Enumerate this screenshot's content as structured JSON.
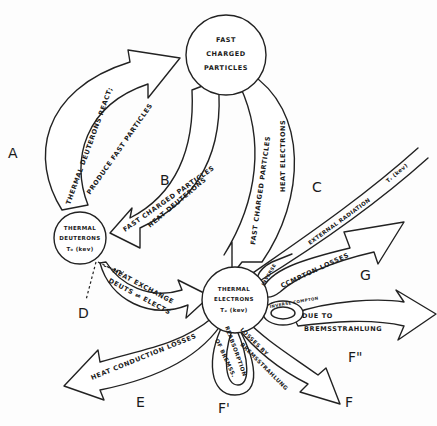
{
  "diagram": {
    "nodes": {
      "fast_charged": {
        "lines": [
          "FAST",
          "CHARGED",
          "PARTICLES"
        ]
      },
      "thermal_deuterons": {
        "lines": [
          "THERMAL",
          "DEUTERONS",
          "T₀ (kev)"
        ]
      },
      "thermal_electrons": {
        "lines": [
          "THERMAL",
          "ELECTRONS",
          "Tₑ (kev)"
        ]
      }
    },
    "arrows": {
      "A": {
        "letter": "A",
        "line1": "THERMAL DEUTERONS REACT;",
        "line2": "PRODUCE FAST PARTICLES"
      },
      "B": {
        "letter": "B",
        "line1": "FAST CHARGED PARTICLES",
        "line2": "HEAT DEUTERONS"
      },
      "C": {
        "letter": "C",
        "line1": "FAST CHARGED PARTICLES",
        "line2": "HEAT ELECTRONS"
      },
      "D": {
        "letter": "D",
        "line1": "HEAT EXCHANGE",
        "line2": "DEUTS ⇌ ELECTS"
      },
      "E": {
        "letter": "E",
        "line1": "HEAT CONDUCTION LOSSES"
      },
      "F": {
        "letter": "F",
        "line1": "LOSSES BY",
        "line2": "BREMSSTRAHLUNG"
      },
      "F_prime": {
        "letter": "F'",
        "line1": "REABSORPTION",
        "line2": "OF BREMSS."
      },
      "F_double": {
        "letter": "F\"",
        "line1": "DUE TO",
        "line2": "BREMSSTRAHLUNG",
        "loop": "INVERSE COMPTON"
      },
      "G": {
        "letter": "G",
        "line1": "CCMPTON LOSSES",
        "loop": "INVERSE"
      },
      "external": {
        "line1": "EXTERNAL RADIATION",
        "temp": "Tᵣ (kev)"
      }
    }
  }
}
